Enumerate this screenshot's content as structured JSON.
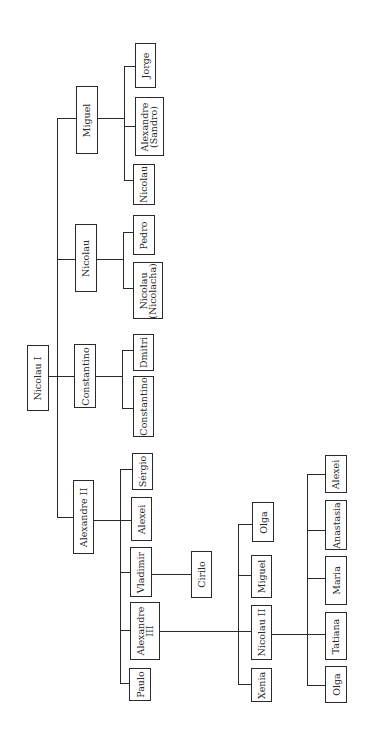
{
  "diagram": {
    "type": "family-tree",
    "orientation": "rotated-90-ccw",
    "root": {
      "name": "Nicolau I",
      "children": [
        {
          "name": "Alexandre II",
          "children": [
            {
              "name": "Paulo"
            },
            {
              "name": "Alexandre III",
              "children": [
                {
                  "name": "Xenia"
                },
                {
                  "name": "Nicolau II",
                  "children": [
                    {
                      "name": "Olga"
                    },
                    {
                      "name": "Tatiana"
                    },
                    {
                      "name": "Maria"
                    },
                    {
                      "name": "Anastasia"
                    },
                    {
                      "name": "Alexei"
                    }
                  ]
                },
                {
                  "name": "Miguel"
                },
                {
                  "name": "Olga"
                }
              ]
            },
            {
              "name": "Vladimir",
              "children": [
                {
                  "name": "Cirilo"
                }
              ]
            },
            {
              "name": "Alexei"
            },
            {
              "name": "Sérgio"
            }
          ]
        },
        {
          "name": "Constantino",
          "children": [
            {
              "name": "Constantino"
            },
            {
              "name": "Dmitri"
            }
          ]
        },
        {
          "name": "Nicolau",
          "children": [
            {
              "name": "Nicolau\n(Nicolacha)"
            },
            {
              "name": "Pedro"
            }
          ]
        },
        {
          "name": "Miguel",
          "children": [
            {
              "name": "Nicolau"
            },
            {
              "name": "Alexandre\n(Sandro)"
            },
            {
              "name": "Jorge"
            }
          ]
        }
      ]
    }
  },
  "nodes": {
    "nicolau_i": "Nicolau I",
    "miguel": "Miguel",
    "nicolau": "Nicolau",
    "constantino": "Constantino",
    "alexandre_ii": "Alexandre II",
    "jorge": "Jorge",
    "alexandre_sandro": "Alexandre\n(Sandro)",
    "nicolau_miguel_son": "Nicolau",
    "pedro": "Pedro",
    "nicolau_nicolacha": "Nicolau\n(Nicolacha)",
    "dmitri": "Dmitri",
    "constantino_son": "Constantino",
    "sergio": "Sérgio",
    "alexei_ii_son": "Alexei",
    "vladimir": "Vladimir",
    "alexandre_iii": "Alexandre\nIII",
    "paulo": "Paulo",
    "cirilo": "Cirilo",
    "olga_iii_daughter": "Olga",
    "miguel_iii_son": "Miguel",
    "nicolau_ii": "Nicolau II",
    "xenia": "Xenia",
    "alexei_tsarevich": "Alexei",
    "anastasia": "Anastasia",
    "maria": "Maria",
    "tatiana": "Tatiana",
    "olga_ii_daughter": "Olga"
  },
  "style": {
    "line_color": "#2a2a2a",
    "box_border_color": "#2a2a2a",
    "background": "#ffffff"
  }
}
